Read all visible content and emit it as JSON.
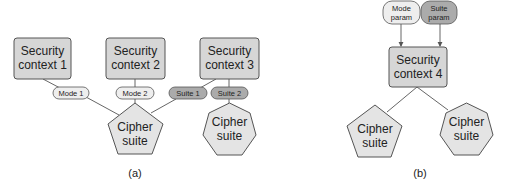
{
  "colors": {
    "box_fill": "#d6d6d6",
    "box_stroke": "#555555",
    "mode_fill": "#eeeeee",
    "suite_fill": "#ababab",
    "cipher_fill": "#e4e4e4",
    "line": "#555555"
  },
  "panel_a": {
    "caption": "(a)",
    "contexts": [
      {
        "line1": "Security",
        "line2": "context 1"
      },
      {
        "line1": "Security",
        "line2": "context 2"
      },
      {
        "line1": "Security",
        "line2": "context 3"
      }
    ],
    "params": [
      {
        "label": "Mode 1",
        "kind": "mode"
      },
      {
        "label": "Mode 2",
        "kind": "mode"
      },
      {
        "label": "Suite 1",
        "kind": "suite"
      },
      {
        "label": "Suite 2",
        "kind": "suite"
      }
    ],
    "ciphers": [
      {
        "line1": "Cipher",
        "line2": "suite",
        "shape": "pentagon"
      },
      {
        "line1": "Cipher",
        "line2": "suite",
        "shape": "heptagon"
      }
    ]
  },
  "panel_b": {
    "caption": "(b)",
    "params": [
      {
        "line1": "Mode",
        "line2": "param",
        "kind": "mode"
      },
      {
        "line1": "Suite",
        "line2": "param",
        "kind": "suite"
      }
    ],
    "context": {
      "line1": "Security",
      "line2": "context 4"
    },
    "ciphers": [
      {
        "line1": "Cipher",
        "line2": "suite",
        "shape": "pentagon"
      },
      {
        "line1": "Cipher",
        "line2": "suite",
        "shape": "heptagon"
      }
    ]
  }
}
